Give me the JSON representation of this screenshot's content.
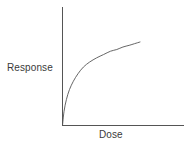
{
  "figure": {
    "background_color": "#ffffff",
    "line_color": "#555555",
    "axis_color": "#555555",
    "text_color": "#3a3a3a"
  },
  "chart_data": {
    "type": "line",
    "title": "",
    "subtitle": "",
    "xlabel": "Dose",
    "ylabel": "Response",
    "xlim": [
      0,
      1
    ],
    "ylim": [
      0,
      1
    ],
    "grid": false,
    "legend": null,
    "xticks": [],
    "yticks": [],
    "xticklabels": [],
    "yticklabels": [],
    "annotations": [],
    "series": [
      {
        "name": "Dose-response",
        "shape": "saturating concave-down curve",
        "x": [
          0.0,
          0.02,
          0.05,
          0.09,
          0.14,
          0.2,
          0.27,
          0.35,
          0.44,
          0.53,
          0.62,
          0.7,
          0.78,
          0.86,
          0.93,
          1.0
        ],
        "y": [
          0.0,
          0.17,
          0.31,
          0.43,
          0.53,
          0.62,
          0.7,
          0.76,
          0.81,
          0.85,
          0.89,
          0.91,
          0.94,
          0.96,
          0.98,
          1.0
        ]
      }
    ]
  },
  "labels": {
    "y_axis": "Response",
    "x_axis": "Dose"
  }
}
